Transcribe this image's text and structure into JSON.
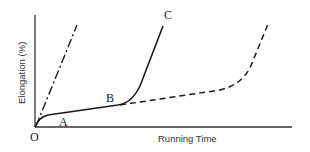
{
  "diagram": {
    "type": "creep-curve",
    "axes": {
      "x_label": "Running Time",
      "y_label": "Elongation (%)",
      "origin_label": "O"
    },
    "points": {
      "A": "A",
      "B": "B",
      "C": "C"
    },
    "curves": [
      {
        "name": "steep-dash-dot",
        "style": "dash-dot",
        "description": "Straight line rising steeply from origin"
      },
      {
        "name": "solid-O-A-B-C",
        "style": "solid",
        "description": "Rapid initial rise, linear segment A to B, then sharp rise to C"
      },
      {
        "name": "dashed-from-B",
        "style": "dashed",
        "description": "Continues from B with shallow slope, then rises steeply later"
      }
    ]
  }
}
